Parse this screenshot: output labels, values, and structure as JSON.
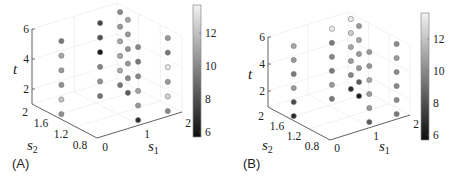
{
  "figure": {
    "panels": [
      {
        "label": "(A)"
      },
      {
        "label": "(B)"
      }
    ]
  },
  "chart_data": [
    {
      "panel_label": "(A)",
      "type": "scatter",
      "projection": "3d",
      "title": "",
      "xlabel": "s1",
      "ylabel": "s2",
      "zlabel": "t",
      "axis_labels": {
        "x": {
          "base": "s",
          "sub": "1"
        },
        "y": {
          "base": "s",
          "sub": "2"
        },
        "z": "t"
      },
      "xlim": [
        0,
        2
      ],
      "ylim": [
        0.8,
        2
      ],
      "zlim": [
        1,
        6
      ],
      "xticks": [
        "0",
        "1",
        "2"
      ],
      "yticks": [
        "0.8",
        "1.2",
        "1.6",
        "2"
      ],
      "zticks": [
        "2",
        "4",
        "6"
      ],
      "grid": true,
      "colorbar": {
        "colormap": "gray",
        "range": [
          5.6,
          13.7
        ],
        "ticks": [
          "6",
          "8",
          "10",
          "12"
        ]
      },
      "columns": [
        {
          "s1": 0.17,
          "s2": 1.59,
          "t": [
            1,
            2,
            3,
            4,
            5,
            6
          ],
          "value": [
            10.2,
            12.1,
            10.3,
            10.5,
            11.0,
            9.4
          ]
        },
        {
          "s1": 1.26,
          "s2": 1.73,
          "t": [
            1,
            2,
            3,
            4,
            5,
            6
          ],
          "value": [
            9.2,
            10.3,
            9.8,
            6.0,
            8.0,
            7.6
          ]
        },
        {
          "s1": 1.87,
          "s2": 1.84,
          "t": [
            1,
            2,
            3,
            4,
            5,
            6
          ],
          "value": [
            9.4,
            11.2,
            11.0,
            11.0,
            10.5,
            10.0
          ]
        },
        {
          "s1": 1.76,
          "s2": 1.61,
          "t": [
            1,
            2,
            3,
            4,
            5,
            6
          ],
          "value": [
            8.3,
            10.0,
            10.5,
            10.4,
            10.5,
            11.0
          ]
        },
        {
          "s1": 1.12,
          "s2": 0.92,
          "t": [
            1,
            2,
            3,
            4,
            5,
            6
          ],
          "value": [
            6.7,
            10.5,
            11.0,
            9.9,
            9.4,
            10.0
          ]
        },
        {
          "s1": 1.82,
          "s2": 0.92,
          "t": [
            1,
            2,
            3,
            4,
            5,
            6
          ],
          "value": [
            10.0,
            12.6,
            10.5,
            13.4,
            9.4,
            10.5
          ]
        }
      ]
    },
    {
      "panel_label": "(B)",
      "type": "scatter",
      "projection": "3d",
      "title": "",
      "xlabel": "s1",
      "ylabel": "s2",
      "zlabel": "t",
      "axis_labels": {
        "x": {
          "base": "s",
          "sub": "1"
        },
        "y": {
          "base": "s",
          "sub": "2"
        },
        "z": "t"
      },
      "xlim": [
        0,
        2
      ],
      "ylim": [
        0.8,
        2
      ],
      "zlim": [
        1,
        6
      ],
      "xticks": [
        "0",
        "1",
        "2"
      ],
      "yticks": [
        "0.8",
        "1.2",
        "1.6",
        "2"
      ],
      "zticks": [
        "2",
        "4",
        "6"
      ],
      "grid": true,
      "colorbar": {
        "colormap": "gray",
        "range": [
          5.65,
          13.6
        ],
        "ticks": [
          "6",
          "8",
          "10",
          "12"
        ]
      },
      "columns": [
        {
          "s1": 0.14,
          "s2": 1.61,
          "t": [
            1,
            2,
            3,
            4,
            5,
            6
          ],
          "value": [
            6.7,
            7.8,
            10.5,
            9.4,
            10.5,
            11.0
          ]
        },
        {
          "s1": 1.25,
          "s2": 1.73,
          "t": [
            1,
            2,
            3,
            4,
            5,
            6
          ],
          "value": [
            9.4,
            10.5,
            9.4,
            9.9,
            9.4,
            13.4
          ]
        },
        {
          "s1": 1.84,
          "s2": 1.82,
          "t": [
            1,
            2,
            3,
            4,
            5,
            6
          ],
          "value": [
            6.7,
            9.9,
            10.5,
            11.0,
            12.3,
            13.4
          ]
        },
        {
          "s1": 1.76,
          "s2": 1.6,
          "t": [
            1,
            2,
            3,
            4,
            5,
            6
          ],
          "value": [
            6.1,
            8.3,
            10.4,
            10.5,
            11.0,
            10.5
          ]
        },
        {
          "s1": 1.15,
          "s2": 0.93,
          "t": [
            1,
            2,
            3,
            4,
            5,
            6
          ],
          "value": [
            8.3,
            10.5,
            10.5,
            11.0,
            10.4,
            10.5
          ]
        },
        {
          "s1": 1.82,
          "s2": 0.92,
          "t": [
            1,
            2,
            3,
            4,
            5,
            6
          ],
          "value": [
            9.4,
            10.0,
            9.9,
            10.0,
            10.5,
            10.0
          ]
        }
      ]
    }
  ]
}
